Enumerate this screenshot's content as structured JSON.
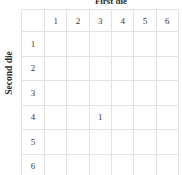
{
  "titles": {
    "top": "First die",
    "left": "Second die"
  },
  "grid": {
    "corner": "",
    "column_headers": [
      "1",
      "2",
      "3",
      "4",
      "5",
      "6"
    ],
    "row_headers": [
      "1",
      "2",
      "3",
      "4",
      "5",
      "6"
    ],
    "rows": [
      [
        "",
        "",
        "",
        "",
        "",
        ""
      ],
      [
        "",
        "",
        "",
        "",
        "",
        ""
      ],
      [
        "",
        "",
        "",
        "",
        "",
        ""
      ],
      [
        "",
        "",
        "1",
        "",
        "",
        ""
      ],
      [
        "",
        "",
        "",
        "",
        "",
        ""
      ],
      [
        "",
        "",
        "",
        "",
        "",
        ""
      ]
    ]
  },
  "colors": {
    "grid_line": "#e2e2e2",
    "text": "#3a3a3a",
    "title_text": "#2b2b2b",
    "background": "#ffffff"
  }
}
